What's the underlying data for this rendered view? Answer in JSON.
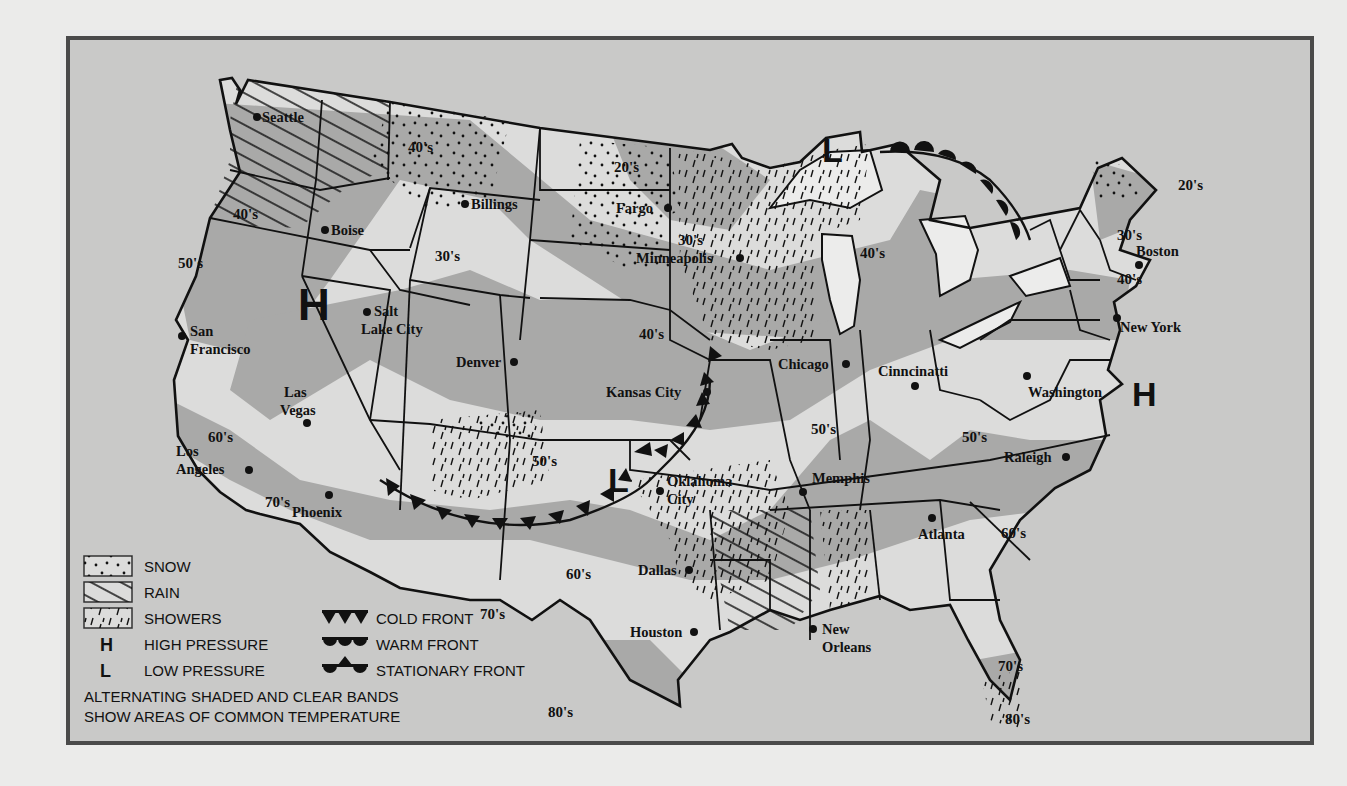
{
  "map": {
    "type": "US weather map",
    "colors": {
      "page_background": "#ebebea",
      "frame_border": "#4a4a4a",
      "ocean": "#c9c9c8",
      "land_clear_band": "#dcdcdb",
      "land_shaded_band": "#a9a9a8",
      "lake_fill": "#ececeb",
      "ink": "#111111"
    },
    "cities": [
      {
        "name": "Seattle",
        "x": 187,
        "y": 77
      },
      {
        "name": "Boise",
        "x": 255,
        "y": 190
      },
      {
        "name": "Billings",
        "x": 395,
        "y": 164
      },
      {
        "name": "Fargo",
        "x": 598,
        "y": 168
      },
      {
        "name": "Minneapolis",
        "x": 670,
        "y": 218
      },
      {
        "name": "Salt Lake City",
        "x": 297,
        "y": 272
      },
      {
        "name": "San Francisco",
        "x": 112,
        "y": 296
      },
      {
        "name": "Denver",
        "x": 444,
        "y": 322
      },
      {
        "name": "Chicago",
        "x": 776,
        "y": 324
      },
      {
        "name": "Boston",
        "x": 1069,
        "y": 225
      },
      {
        "name": "New York",
        "x": 1047,
        "y": 278
      },
      {
        "name": "Las Vegas",
        "x": 237,
        "y": 383
      },
      {
        "name": "Kansas City",
        "x": 637,
        "y": 352
      },
      {
        "name": "Cinncinatti",
        "x": 845,
        "y": 346
      },
      {
        "name": "Washington",
        "x": 957,
        "y": 336
      },
      {
        "name": "Los Angeles",
        "x": 179,
        "y": 430
      },
      {
        "name": "Phoenix",
        "x": 259,
        "y": 455
      },
      {
        "name": "Oklahoma City",
        "x": 590,
        "y": 451
      },
      {
        "name": "Memphis",
        "x": 733,
        "y": 452
      },
      {
        "name": "Raleigh",
        "x": 996,
        "y": 417
      },
      {
        "name": "Atlanta",
        "x": 862,
        "y": 478
      },
      {
        "name": "Dallas",
        "x": 619,
        "y": 530
      },
      {
        "name": "Houston",
        "x": 624,
        "y": 592
      },
      {
        "name": "New Orleans",
        "x": 743,
        "y": 589
      }
    ],
    "temperature_bands": [
      {
        "label": "40's",
        "x": 338,
        "y": 112
      },
      {
        "label": "40's",
        "x": 163,
        "y": 179
      },
      {
        "label": "20's",
        "x": 544,
        "y": 132
      },
      {
        "label": "20's",
        "x": 1108,
        "y": 150
      },
      {
        "label": "30's",
        "x": 608,
        "y": 205
      },
      {
        "label": "30's",
        "x": 365,
        "y": 221
      },
      {
        "label": "30's",
        "x": 1047,
        "y": 200
      },
      {
        "label": "40's",
        "x": 790,
        "y": 218
      },
      {
        "label": "40's",
        "x": 1047,
        "y": 244
      },
      {
        "label": "50's",
        "x": 108,
        "y": 228
      },
      {
        "label": "40's",
        "x": 569,
        "y": 299
      },
      {
        "label": "50's",
        "x": 741,
        "y": 394
      },
      {
        "label": "50's",
        "x": 892,
        "y": 402
      },
      {
        "label": "60's",
        "x": 138,
        "y": 402
      },
      {
        "label": "50's",
        "x": 462,
        "y": 426
      },
      {
        "label": "70's",
        "x": 195,
        "y": 467
      },
      {
        "label": "60's",
        "x": 931,
        "y": 498
      },
      {
        "label": "60's",
        "x": 496,
        "y": 539
      },
      {
        "label": "70's",
        "x": 410,
        "y": 579
      },
      {
        "label": "70's",
        "x": 928,
        "y": 631
      },
      {
        "label": "80's",
        "x": 478,
        "y": 677
      },
      {
        "label": "80's",
        "x": 935,
        "y": 684
      }
    ],
    "pressure_systems": [
      {
        "symbol": "H",
        "meaning": "HIGH PRESSURE",
        "location": "Great Basin / Nevada-Utah",
        "x": 252,
        "y": 267
      },
      {
        "symbol": "H",
        "meaning": "HIGH PRESSURE",
        "location": "Atlantic off Mid-Atlantic coast",
        "x": 1083,
        "y": 353
      },
      {
        "symbol": "L",
        "meaning": "LOW PRESSURE",
        "location": "Lake Superior",
        "x": 763,
        "y": 107
      },
      {
        "symbol": "L",
        "meaning": "LOW PRESSURE",
        "location": "Texas/Oklahoma panhandle",
        "x": 552,
        "y": 437
      }
    ],
    "fronts": [
      {
        "type": "COLD FRONT",
        "path": "Arizona → New Mexico → Texas panhandle → Oklahoma → Kansas City"
      },
      {
        "type": "WARM FRONT",
        "path": "Lake Superior low → Upper Michigan → Lake Huron"
      }
    ]
  },
  "legend": {
    "items": [
      {
        "symbol": "snow-pattern",
        "label": "SNOW"
      },
      {
        "symbol": "rain-pattern",
        "label": "RAIN"
      },
      {
        "symbol": "showers-pattern",
        "label": "SHOWERS"
      },
      {
        "symbol": "H",
        "label": "HIGH PRESSURE"
      },
      {
        "symbol": "L",
        "label": "LOW PRESSURE"
      }
    ],
    "fronts": [
      {
        "symbol": "cold-front-triangles",
        "label": "COLD FRONT"
      },
      {
        "symbol": "warm-front-semicircles",
        "label": "WARM FRONT"
      },
      {
        "symbol": "stationary-front",
        "label": "STATIONARY FRONT"
      }
    ],
    "note_line1": "ALTERNATING SHADED AND CLEAR BANDS",
    "note_line2": "SHOW AREAS OF COMMON TEMPERATURE"
  }
}
